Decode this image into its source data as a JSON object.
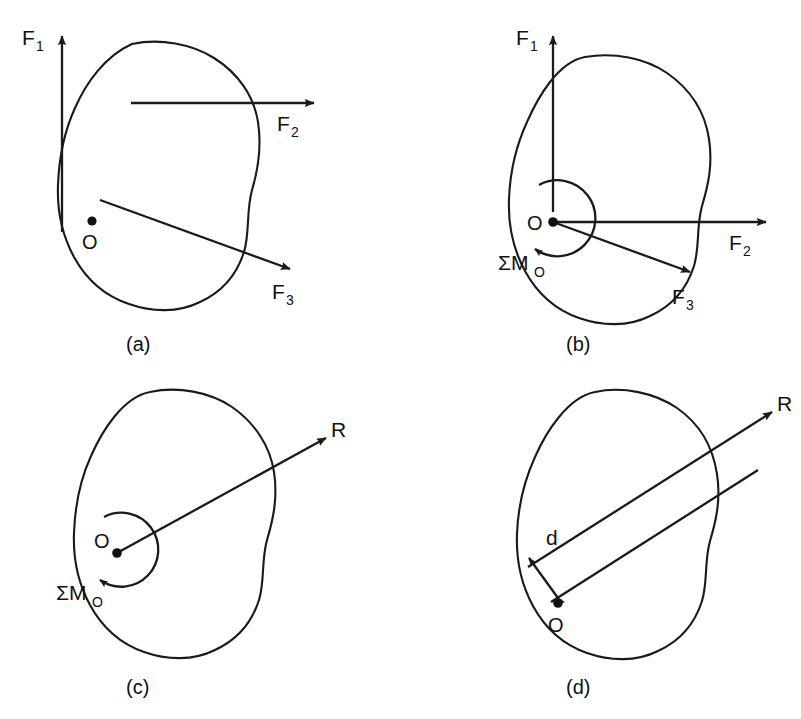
{
  "figure": {
    "type": "statics-force-resultant-diagram",
    "stroke_color": "#1a1a1a",
    "background_color": "#ffffff",
    "panel_count": 4
  },
  "panels": [
    {
      "id": "a",
      "caption": "(a)",
      "description": "Rigid body acted on by three forces at different points of application",
      "point_label": "O",
      "force_labels": [
        {
          "base": "F",
          "sub": "1",
          "full": "F1"
        },
        {
          "base": "F",
          "sub": "2",
          "full": "F2"
        },
        {
          "base": "F",
          "sub": "3",
          "full": "F3"
        }
      ],
      "moment_label": null
    },
    {
      "id": "b",
      "caption": "(b)",
      "description": "Forces moved to point O with an accompanying resultant couple",
      "point_label": "O",
      "force_labels": [
        {
          "base": "F",
          "sub": "1",
          "full": "F1"
        },
        {
          "base": "F",
          "sub": "2",
          "full": "F2"
        },
        {
          "base": "F",
          "sub": "3",
          "full": "F3"
        }
      ],
      "moment_label": {
        "base": "ΣM",
        "sub": "O",
        "full": "ΣMO"
      }
    },
    {
      "id": "c",
      "caption": "(c)",
      "description": "Forces combined into a single resultant R at O plus the couple",
      "point_label": "O",
      "force_labels": [
        {
          "base": "R",
          "sub": "",
          "full": "R"
        }
      ],
      "moment_label": {
        "base": "ΣM",
        "sub": "O",
        "full": "ΣMO"
      }
    },
    {
      "id": "d",
      "caption": "(d)",
      "description": "Resultant R relocated to a line of action a distance d from O",
      "point_label": "O",
      "force_labels": [
        {
          "base": "R",
          "sub": "",
          "full": "R"
        }
      ],
      "distance_label": "d",
      "moment_label": null
    }
  ],
  "labels": {
    "f1": "F",
    "f1_sub": "1",
    "f2": "F",
    "f2_sub": "2",
    "f3": "F",
    "f3_sub": "3",
    "resultant": "R",
    "moment": "ΣM",
    "moment_sub": "O",
    "origin": "O",
    "distance": "d",
    "caption_a": "(a)",
    "caption_b": "(b)",
    "caption_c": "(c)",
    "caption_d": "(d)"
  }
}
